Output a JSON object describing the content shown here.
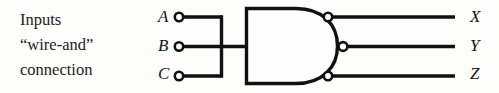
{
  "figure": {
    "background_color": "#fdfdfc",
    "ink_color": "#111111"
  },
  "caption": {
    "lines": [
      "Inputs",
      "“wire-and”",
      "connection"
    ],
    "line1": "Inputs",
    "line2": "“wire-and”",
    "line3": "connection"
  },
  "inputs": {
    "labels": [
      {
        "name": "A",
        "row": "top"
      },
      {
        "name": "B",
        "row": "middle"
      },
      {
        "name": "C",
        "row": "bottom"
      }
    ],
    "a_label": "A",
    "b_label": "B",
    "c_label": "C",
    "terminal_icon": "open-circle-terminal"
  },
  "outputs": {
    "labels": [
      {
        "name": "X",
        "row": "top"
      },
      {
        "name": "Y",
        "row": "middle"
      },
      {
        "name": "Z",
        "row": "bottom"
      }
    ],
    "x_label": "X",
    "y_label": "Y",
    "z_label": "Z",
    "terminal_icon": "open-circle-terminal"
  },
  "gate": {
    "shape": "and-gate-body",
    "note": "flat left edge, rounded right edge"
  },
  "junction": {
    "shape": "wire-and-vertical-bus",
    "note": "A, B and C wires tied together on a vertical bus"
  }
}
